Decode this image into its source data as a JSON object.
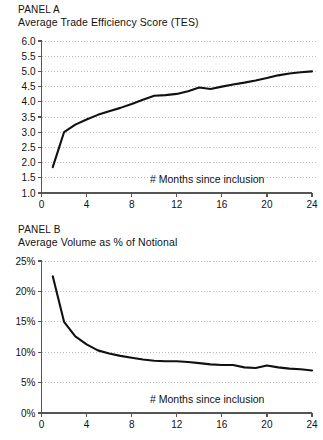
{
  "figure": {
    "background_color": "#ffffff",
    "line_color": "#111111",
    "grid_color": "#b9b9b9",
    "axis_color": "#555555"
  },
  "panels": [
    {
      "id": "panel-a",
      "label": "PANEL A",
      "subtitle": "Average Trade Efficiency Score (TES)",
      "axis_note": "# Months since inclusion"
    },
    {
      "id": "panel-b",
      "label": "PANEL B",
      "subtitle": "Average Volume as % of Notional",
      "axis_note": "# Months since inclusion"
    }
  ],
  "chart_data": [
    {
      "type": "line",
      "title": "PANEL A",
      "subtitle": "Average Trade Efficiency Score (TES)",
      "xlabel": "# Months since inclusion",
      "ylabel": "",
      "xlim": [
        0,
        24
      ],
      "ylim": [
        1.0,
        6.0
      ],
      "xticks": [
        0,
        4,
        8,
        12,
        16,
        20,
        24
      ],
      "xticklabels": [
        "0",
        "4",
        "8",
        "12",
        "16",
        "20",
        "24"
      ],
      "yticks": [
        1.0,
        1.5,
        2.0,
        2.5,
        3.0,
        3.5,
        4.0,
        4.5,
        5.0,
        5.5,
        6.0
      ],
      "yticklabels": [
        "1.0",
        "1.5",
        "2.0",
        "2.5",
        "3.0",
        "3.5",
        "4.0",
        "4.5",
        "5.0",
        "5.5",
        "6.0"
      ],
      "grid": true,
      "grid_axis": "y",
      "legend": false,
      "x": [
        1,
        2,
        3,
        4,
        5,
        6,
        7,
        8,
        9,
        10,
        11,
        12,
        13,
        14,
        15,
        16,
        17,
        18,
        19,
        20,
        21,
        22,
        23,
        24
      ],
      "values": [
        1.85,
        3.0,
        3.25,
        3.42,
        3.57,
        3.69,
        3.8,
        3.93,
        4.07,
        4.2,
        4.22,
        4.26,
        4.35,
        4.47,
        4.42,
        4.5,
        4.57,
        4.63,
        4.7,
        4.78,
        4.87,
        4.93,
        4.97,
        5.0
      ],
      "series": [
        {
          "name": "Average Trade Efficiency Score (TES)",
          "values": [
            1.85,
            3.0,
            3.25,
            3.42,
            3.57,
            3.69,
            3.8,
            3.93,
            4.07,
            4.2,
            4.22,
            4.26,
            4.35,
            4.47,
            4.42,
            4.5,
            4.57,
            4.63,
            4.7,
            4.78,
            4.87,
            4.93,
            4.97,
            5.0
          ]
        }
      ]
    },
    {
      "type": "line",
      "title": "PANEL B",
      "subtitle": "Average Volume as % of Notional",
      "xlabel": "# Months since inclusion",
      "ylabel": "",
      "xlim": [
        0,
        24
      ],
      "ylim": [
        0,
        25
      ],
      "xticks": [
        0,
        4,
        8,
        12,
        16,
        20,
        24
      ],
      "xticklabels": [
        "0",
        "4",
        "8",
        "12",
        "16",
        "20",
        "24"
      ],
      "yticks": [
        0,
        5,
        10,
        15,
        20,
        25
      ],
      "yticklabels": [
        "0%",
        "5%",
        "10%",
        "15%",
        "20%",
        "25%"
      ],
      "grid": true,
      "grid_axis": "y",
      "legend": false,
      "x": [
        1,
        2,
        3,
        4,
        5,
        6,
        7,
        8,
        9,
        10,
        11,
        12,
        13,
        14,
        15,
        16,
        17,
        18,
        19,
        20,
        21,
        22,
        23,
        24
      ],
      "values": [
        22.5,
        15.0,
        12.6,
        11.3,
        10.3,
        9.8,
        9.4,
        9.1,
        8.8,
        8.6,
        8.5,
        8.5,
        8.4,
        8.2,
        8.0,
        7.9,
        7.9,
        7.5,
        7.4,
        7.8,
        7.5,
        7.3,
        7.2,
        7.0
      ],
      "series": [
        {
          "name": "Average Volume as % of Notional",
          "values": [
            22.5,
            15.0,
            12.6,
            11.3,
            10.3,
            9.8,
            9.4,
            9.1,
            8.8,
            8.6,
            8.5,
            8.5,
            8.4,
            8.2,
            8.0,
            7.9,
            7.9,
            7.5,
            7.4,
            7.8,
            7.5,
            7.3,
            7.2,
            7.0
          ]
        }
      ]
    }
  ]
}
